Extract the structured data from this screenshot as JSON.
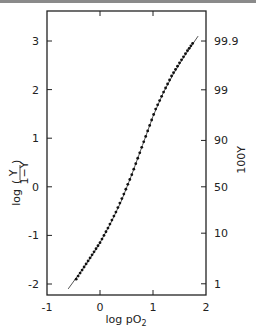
{
  "chart_data": {
    "type": "line",
    "title": "",
    "xlabel": "log pO2",
    "ylabel": "log (Y/(1-Y))",
    "ylabel_right": "100Y",
    "xlim": [
      -1,
      2
    ],
    "ylim": [
      -2.2,
      3.6
    ],
    "grid": false,
    "x_ticks": [
      "-1",
      "0",
      "1",
      "2"
    ],
    "y_ticks": [
      "-2",
      "-1",
      "0",
      "1",
      "2",
      "3"
    ],
    "y_ticks_right": [
      "1",
      "10",
      "50",
      "90",
      "99",
      "99.9"
    ],
    "series": [
      {
        "name": "fitted curve",
        "style": "thin line",
        "x": [
          -0.6,
          -0.4,
          -0.2,
          0.0,
          0.2,
          0.4,
          0.6,
          0.8,
          1.0,
          1.2,
          1.4,
          1.6,
          1.85
        ],
        "y": [
          -2.1,
          -1.8,
          -1.5,
          -1.15,
          -0.75,
          -0.3,
          0.25,
          0.85,
          1.45,
          1.95,
          2.35,
          2.7,
          3.1
        ]
      },
      {
        "name": "data points",
        "style": "dense filled dots",
        "x": [
          -0.45,
          -0.3,
          -0.15,
          0.0,
          0.15,
          0.3,
          0.45,
          0.6,
          0.75,
          0.9,
          1.05,
          1.2,
          1.35,
          1.5,
          1.65,
          1.78
        ],
        "y": [
          -1.9,
          -1.65,
          -1.4,
          -1.15,
          -0.85,
          -0.52,
          -0.15,
          0.25,
          0.7,
          1.15,
          1.6,
          1.95,
          2.28,
          2.55,
          2.8,
          3.0
        ]
      }
    ]
  },
  "labels": {
    "xlabel_main": "log pO",
    "xlabel_sub": "2",
    "ylabel_left_prefix": "log",
    "ylabel_left_num": "Y",
    "ylabel_left_den": "1−Y",
    "ylabel_right": "100Y"
  }
}
